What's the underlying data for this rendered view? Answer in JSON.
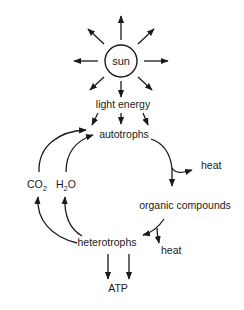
{
  "diagram": {
    "type": "energy-flow cycle",
    "nodes": {
      "sun": "sun",
      "light_energy": "light energy",
      "autotrophs": "autotrophs",
      "heat_1": "heat",
      "organic_compounds": "organic compounds",
      "heterotrophs": "heterotrophs",
      "heat_2": "heat",
      "atp": "ATP",
      "co2_main": "CO",
      "co2_sub": "2",
      "h2o_h": "H",
      "h2o_sub": "2",
      "h2o_o": "O"
    },
    "edges": [
      {
        "from": "sun",
        "to": "radiating (8 directions)"
      },
      {
        "from": "light energy",
        "to": "autotrophs"
      },
      {
        "from": "autotrophs",
        "to": "organic compounds"
      },
      {
        "from": "autotrophs",
        "to": "heat"
      },
      {
        "from": "organic compounds",
        "to": "heterotrophs"
      },
      {
        "from": "organic compounds",
        "to": "heat"
      },
      {
        "from": "heterotrophs",
        "to": "ATP"
      },
      {
        "from": "heterotrophs",
        "to": "CO2"
      },
      {
        "from": "heterotrophs",
        "to": "H2O"
      },
      {
        "from": "CO2",
        "to": "autotrophs"
      },
      {
        "from": "H2O",
        "to": "autotrophs"
      }
    ],
    "colors": {
      "ink": "#1a1a1a",
      "background": "#ffffff"
    }
  }
}
